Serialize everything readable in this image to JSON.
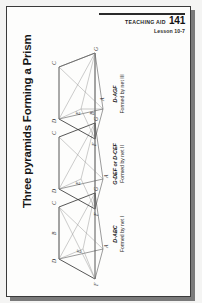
{
  "header": {
    "aid_label": "Teaching Aid",
    "aid_number": "141",
    "lesson": "Lesson 10-7"
  },
  "title": "Three pyramids Forming a Prism",
  "figures": [
    {
      "id": "figure-1",
      "name": "D-ABC",
      "sub": "Formed by net I",
      "vertices": [
        "D",
        "A",
        "B",
        "C",
        "E",
        "F",
        "G"
      ]
    },
    {
      "id": "figure-2",
      "name": "G-DEF or D-CEF",
      "sub": "Formed by net II",
      "vertices": [
        "D",
        "A",
        "C",
        "E",
        "F",
        "G"
      ]
    },
    {
      "id": "figure-3",
      "name": "D-AGF",
      "sub": "Formed by net III",
      "vertices": [
        "D",
        "A",
        "B",
        "C",
        "E",
        "F",
        "G"
      ]
    }
  ],
  "colors": {
    "ink": "#1d1d1d",
    "rule": "#2b2b2b",
    "edge": "#4a4a4a",
    "page": "#fdfdfc",
    "backdrop": "#f4f4f3",
    "shadow": "#7a7a7a"
  }
}
